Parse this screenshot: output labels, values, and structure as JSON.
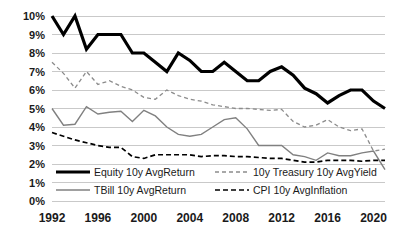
{
  "chart_data": {
    "type": "line",
    "title": "",
    "xlabel": "",
    "ylabel": "",
    "xlim": [
      1992,
      2021
    ],
    "ylim": [
      0,
      10
    ],
    "ytick_labels": [
      "0%",
      "1%",
      "2%",
      "3%",
      "4%",
      "5%",
      "6%",
      "7%",
      "8%",
      "9%",
      "10%"
    ],
    "ytick_values": [
      0,
      1,
      2,
      3,
      4,
      5,
      6,
      7,
      8,
      9,
      10
    ],
    "xtick_labels": [
      "1992",
      "1996",
      "2000",
      "2004",
      "2008",
      "2012",
      "2016",
      "2020"
    ],
    "xtick_values": [
      1992,
      1996,
      2000,
      2004,
      2008,
      2012,
      2016,
      2020
    ],
    "grid": "horizontal",
    "legend_position": "inside-bottom",
    "x": [
      1992,
      1993,
      1994,
      1995,
      1996,
      1997,
      1998,
      1999,
      2000,
      2001,
      2002,
      2003,
      2004,
      2005,
      2006,
      2007,
      2008,
      2009,
      2010,
      2011,
      2012,
      2013,
      2014,
      2015,
      2016,
      2017,
      2018,
      2019,
      2020,
      2021
    ],
    "series": [
      {
        "name": "Equity 10y AvgReturn",
        "color": "#000000",
        "style": "solid",
        "width": 3.2,
        "values": [
          10.0,
          9.0,
          10.0,
          8.2,
          9.0,
          9.0,
          9.0,
          8.0,
          8.0,
          7.5,
          7.0,
          8.0,
          7.6,
          7.0,
          7.0,
          7.5,
          7.0,
          6.5,
          6.5,
          7.0,
          7.25,
          6.8,
          6.1,
          5.8,
          5.3,
          5.7,
          6.0,
          6.0,
          5.4,
          5.0
        ]
      },
      {
        "name": "10y Treasury 10y AvgYield",
        "color": "#8c8c8c",
        "style": "dashed",
        "width": 1.3,
        "values": [
          7.5,
          6.9,
          6.1,
          7.0,
          6.3,
          6.5,
          6.2,
          6.0,
          5.6,
          5.5,
          6.0,
          5.7,
          5.5,
          5.4,
          5.2,
          5.1,
          5.0,
          5.0,
          4.95,
          4.9,
          4.95,
          4.3,
          4.0,
          4.1,
          4.4,
          4.0,
          3.8,
          3.9,
          2.7,
          2.8
        ]
      },
      {
        "name": "TBill 10y AvgReturn",
        "color": "#808080",
        "style": "solid",
        "width": 1.4,
        "values": [
          5.0,
          4.1,
          4.15,
          5.1,
          4.7,
          4.8,
          4.85,
          4.3,
          4.9,
          4.6,
          4.0,
          3.6,
          3.5,
          3.6,
          4.0,
          4.4,
          4.5,
          3.9,
          3.0,
          3.0,
          3.0,
          2.5,
          2.4,
          2.2,
          2.6,
          2.45,
          2.45,
          2.6,
          2.7,
          1.7
        ]
      },
      {
        "name": "CPI 10y  AvgInflation",
        "color": "#000000",
        "style": "dashed",
        "width": 1.7,
        "values": [
          3.7,
          3.5,
          3.3,
          3.15,
          3.0,
          2.9,
          2.9,
          2.4,
          2.3,
          2.5,
          2.5,
          2.5,
          2.5,
          2.4,
          2.45,
          2.45,
          2.4,
          2.4,
          2.35,
          2.3,
          2.3,
          2.2,
          2.1,
          2.1,
          2.2,
          2.2,
          2.2,
          2.15,
          2.2,
          2.2
        ]
      }
    ]
  },
  "legend": {
    "items": [
      {
        "label": "Equity 10y AvgReturn",
        "marker": "solid-thick-black"
      },
      {
        "label": "10y Treasury 10y AvgYield",
        "marker": "dashed-gray"
      },
      {
        "label": "TBill 10y AvgReturn",
        "marker": "solid-gray"
      },
      {
        "label": "CPI 10y  AvgInflation",
        "marker": "dashed-black"
      }
    ]
  }
}
